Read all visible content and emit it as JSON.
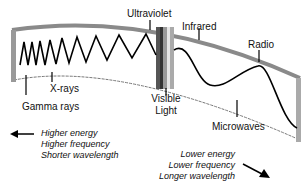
{
  "diagram": {
    "bands": {
      "ultraviolet": "Ultraviolet",
      "infrared": "Infrared",
      "radio": "Radio",
      "xrays": "X-rays",
      "gamma": "Gamma rays",
      "visible_line1": "Visible",
      "visible_line2": "Light",
      "microwaves": "Microwaves"
    },
    "left_note": [
      "Higher energy",
      "Higher frequency",
      "Shorter wavelength"
    ],
    "right_note": [
      "Lower energy",
      "Lower frequency",
      "Longer wavelength"
    ],
    "colors": {
      "frame": "#888888",
      "wave": "#000000",
      "visible_strip": [
        "#555555",
        "#333333",
        "#999999",
        "#dddddd",
        "#aaaaaa"
      ]
    }
  }
}
